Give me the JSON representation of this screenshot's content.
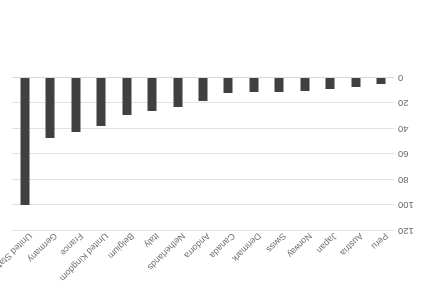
{
  "chart_data": {
    "type": "bar",
    "title": "",
    "subtitle": "",
    "xlabel": "",
    "ylabel": "",
    "categories": [
      "Peru",
      "Austria",
      "Japan",
      "Norway",
      "Swiss",
      "Denmark",
      "Canada",
      "Andorra",
      "Netherlands",
      "Italy",
      "Belgium",
      "United Kingdom",
      "France",
      "Germany",
      "United States"
    ],
    "values": [
      5,
      7,
      9,
      10,
      11,
      11,
      12,
      18,
      23,
      26,
      29,
      38,
      42,
      47,
      100
    ],
    "ylim": [
      0,
      120
    ],
    "yticks": [
      0,
      20,
      40,
      60,
      80,
      100,
      120
    ],
    "ytick_labels": [
      "0",
      "20",
      "40",
      "60",
      "80",
      "100",
      "120"
    ],
    "grid": true,
    "legend": false,
    "legend_position": "none",
    "orientation": "upside-down",
    "rotation_degrees": 180,
    "bar_color": "#404040",
    "gridline_color": "#e2e2e2",
    "tick_label_color": "#6a6a6a",
    "category_label_color": "#6f6f6f",
    "background_color": "#ffffff",
    "category_label_angle": -45
  }
}
